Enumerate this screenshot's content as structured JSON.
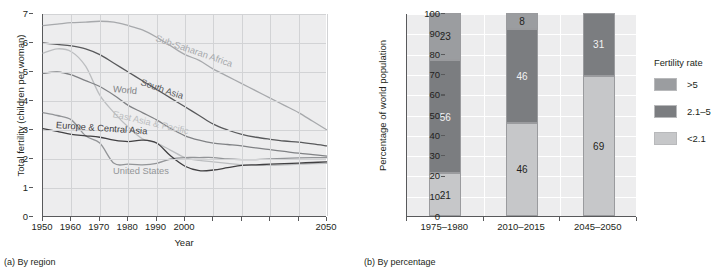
{
  "figure": {
    "panel_a_caption": "(a) By region",
    "panel_b_caption": "(b) By percentage"
  },
  "chart_data": [
    {
      "type": "line",
      "title": "(a) By region",
      "xlabel": "Year",
      "ylabel": "Total fertility (children per woman)",
      "xlim": [
        1950,
        2050
      ],
      "ylim": [
        0,
        7
      ],
      "xticks": [
        1950,
        1960,
        1970,
        1980,
        1990,
        2000,
        2010,
        2020,
        2030,
        2040,
        2050
      ],
      "xtick_labels": [
        "1950",
        "1960",
        "1970",
        "1980",
        "1990",
        "2000",
        "2050"
      ],
      "xtick_labels_shown": [
        "1950",
        "1960",
        "1970",
        "1980",
        "1990",
        "2000",
        "2050"
      ],
      "yticks": [
        0,
        1,
        2,
        3,
        4,
        5,
        6,
        7
      ],
      "ytick_labels": [
        "0",
        "1",
        "2",
        "3",
        "4",
        "5",
        "6",
        "7"
      ],
      "grid": true,
      "legend_position": "inline-labels",
      "x": [
        1950,
        1955,
        1960,
        1965,
        1970,
        1975,
        1980,
        1985,
        1990,
        1995,
        2000,
        2005,
        2010,
        2015,
        2020,
        2025,
        2030,
        2035,
        2040,
        2045,
        2050
      ],
      "series": [
        {
          "name": "Sub-Saharan Africa",
          "color": "#a7a9ac",
          "values": [
            6.6,
            6.65,
            6.7,
            6.72,
            6.75,
            6.72,
            6.6,
            6.45,
            6.2,
            5.9,
            5.6,
            5.4,
            5.1,
            4.85,
            4.6,
            4.35,
            4.1,
            3.85,
            3.6,
            3.3,
            3.0
          ]
        },
        {
          "name": "South Asia",
          "color": "#58595b",
          "values": [
            6.0,
            5.95,
            5.9,
            5.8,
            5.6,
            5.3,
            5.0,
            4.7,
            4.4,
            4.1,
            3.8,
            3.5,
            3.2,
            3.0,
            2.85,
            2.75,
            2.68,
            2.62,
            2.58,
            2.52,
            2.45
          ]
        },
        {
          "name": "East Asia & Pacific",
          "color": "#bcbec0",
          "values": [
            5.65,
            5.8,
            5.7,
            5.2,
            4.2,
            3.6,
            3.1,
            2.7,
            2.55,
            2.3,
            2.05,
            1.95,
            1.9,
            1.85,
            1.8,
            1.78,
            1.78,
            1.8,
            1.82,
            1.84,
            1.85
          ]
        },
        {
          "name": "World",
          "color": "#808285",
          "values": [
            4.95,
            5.0,
            4.9,
            4.7,
            4.5,
            4.2,
            3.85,
            3.6,
            3.35,
            3.05,
            2.8,
            2.65,
            2.55,
            2.5,
            2.45,
            2.38,
            2.32,
            2.26,
            2.2,
            2.15,
            2.1
          ]
        },
        {
          "name": "United States",
          "color": "#939598",
          "values": [
            3.6,
            3.5,
            3.35,
            2.8,
            2.55,
            1.85,
            1.82,
            1.8,
            1.85,
            2.0,
            2.05,
            2.05,
            2.05,
            2.0,
            1.98,
            1.98,
            2.0,
            2.02,
            2.04,
            2.05,
            2.05
          ]
        },
        {
          "name": "Europe & Central Asia",
          "color": "#414042",
          "values": [
            3.05,
            2.95,
            2.85,
            2.8,
            2.75,
            2.65,
            2.6,
            2.65,
            2.55,
            2.1,
            1.75,
            1.6,
            1.62,
            1.7,
            1.78,
            1.8,
            1.82,
            1.84,
            1.86,
            1.88,
            1.9
          ]
        }
      ]
    },
    {
      "type": "bar",
      "stacked": true,
      "title": "(b) By percentage",
      "xlabel": "",
      "ylabel": "Percentage of world population",
      "ylim": [
        0,
        100
      ],
      "yticks": [
        0,
        10,
        20,
        30,
        40,
        50,
        60,
        70,
        80,
        90,
        100
      ],
      "ytick_labels": [
        "0",
        "10",
        "20",
        "30",
        "40",
        "50",
        "60",
        "70",
        "80",
        "90",
        "100"
      ],
      "grid": true,
      "legend_title": "Fertility rate",
      "legend_position": "right",
      "categories": [
        "1975–1980",
        "2010–2015",
        "2045–2050"
      ],
      "series": [
        {
          "name": ">5",
          "color": "#9b9da0",
          "values": [
            23,
            8,
            0
          ]
        },
        {
          "name": "2.1–5",
          "color": "#7b7d80",
          "values": [
            56,
            46,
            31
          ]
        },
        {
          "name": "<2.1",
          "color": "#c6c7c9",
          "values": [
            21,
            46,
            69
          ]
        }
      ]
    }
  ]
}
